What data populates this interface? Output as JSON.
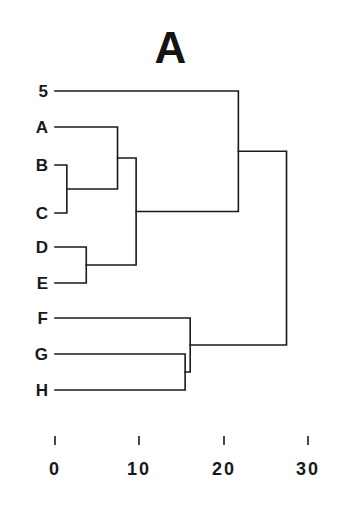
{
  "figure": {
    "title": "A",
    "width": 341,
    "height": 514,
    "background_color": "#ffffff",
    "line_color": "#1a1a1a",
    "text_color": "#191919"
  },
  "chart_data": {
    "type": "dendrogram",
    "title": "A",
    "xlabel": "",
    "ylabel": "",
    "orientation": "horizontal",
    "grid": false,
    "legend": false,
    "xlim": [
      0,
      32
    ],
    "xticks": [
      0,
      10,
      20,
      30
    ],
    "xtick_labels": [
      "0",
      "10",
      "20",
      "30"
    ],
    "leaves": [
      {
        "label": "5",
        "order": 0,
        "pixel_y": 91
      },
      {
        "label": "A",
        "order": 1,
        "pixel_y": 127
      },
      {
        "label": "B",
        "order": 2,
        "pixel_y": 165
      },
      {
        "label": "C",
        "order": 3,
        "pixel_y": 213
      },
      {
        "label": "D",
        "order": 4,
        "pixel_y": 247
      },
      {
        "label": "E",
        "order": 5,
        "pixel_y": 283
      },
      {
        "label": "F",
        "order": 6,
        "pixel_y": 318
      },
      {
        "label": "G",
        "order": 7,
        "pixel_y": 354
      },
      {
        "label": "H",
        "order": 8,
        "pixel_y": 390
      }
    ],
    "merges": [
      {
        "id": "n1",
        "members": [
          "B",
          "C"
        ],
        "distance": 1.4
      },
      {
        "id": "n2",
        "members": [
          "D",
          "E"
        ],
        "distance": 3.7
      },
      {
        "id": "n3",
        "members": [
          "A",
          "B",
          "C"
        ],
        "distance": 7.4
      },
      {
        "id": "n4",
        "members": [
          "A",
          "B",
          "C",
          "D",
          "E"
        ],
        "distance": 9.6
      },
      {
        "id": "n5",
        "members": [
          "G",
          "H"
        ],
        "distance": 15.4
      },
      {
        "id": "n6",
        "members": [
          "F",
          "G",
          "H"
        ],
        "distance": 16.0
      },
      {
        "id": "n7",
        "members": [
          "5",
          "A",
          "B",
          "C",
          "D",
          "E"
        ],
        "distance": 21.7
      },
      {
        "id": "n8",
        "members": [
          "5",
          "A",
          "B",
          "C",
          "D",
          "E",
          "F",
          "G",
          "H"
        ],
        "distance": 27.4
      }
    ]
  },
  "axis": {
    "ticks": [
      {
        "value": "0",
        "pixel_x": 55
      },
      {
        "value": "10",
        "pixel_x": 139
      },
      {
        "value": "20",
        "pixel_x": 224
      },
      {
        "value": "30",
        "pixel_x": 308
      }
    ]
  },
  "leaf_labels": [
    {
      "text": "5",
      "pixel_x": 22,
      "pixel_y": 83
    },
    {
      "text": "A",
      "pixel_x": 22,
      "pixel_y": 119
    },
    {
      "text": "B",
      "pixel_x": 22,
      "pixel_y": 157
    },
    {
      "text": "C",
      "pixel_x": 22,
      "pixel_y": 205
    },
    {
      "text": "D",
      "pixel_x": 22,
      "pixel_y": 239
    },
    {
      "text": "E",
      "pixel_x": 22,
      "pixel_y": 275
    },
    {
      "text": "F",
      "pixel_x": 22,
      "pixel_y": 310
    },
    {
      "text": "G",
      "pixel_x": 22,
      "pixel_y": 346
    },
    {
      "text": "H",
      "pixel_x": 22,
      "pixel_y": 382
    }
  ]
}
